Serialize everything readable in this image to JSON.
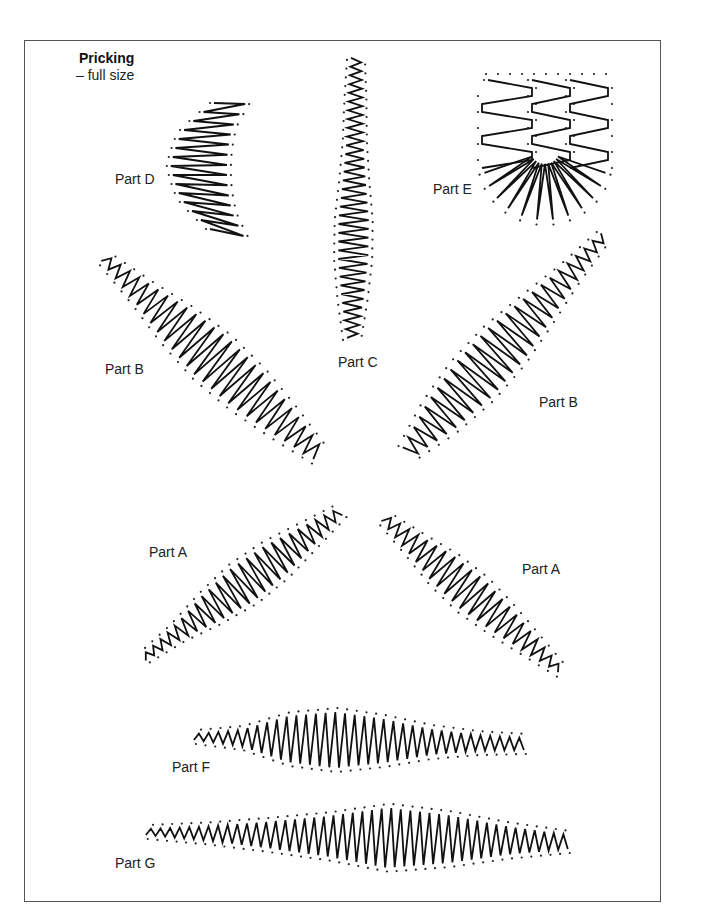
{
  "header": {
    "title": "Pricking",
    "subtitle": "– full size"
  },
  "colors": {
    "frame": "#555555",
    "thread": "#111111",
    "holes": "#222222"
  },
  "parts": [
    {
      "id": "part-d",
      "label": "Part D",
      "label_pos": [
        115,
        172
      ],
      "shape": {
        "start": [
          214,
          100
        ],
        "end": [
          212,
          236
        ],
        "bend": -30,
        "stitches": 14,
        "width": [
          34,
          50,
          56,
          50,
          36
        ],
        "style": "fan"
      }
    },
    {
      "id": "part-c",
      "label": "Part C",
      "label_pos": [
        338,
        355
      ],
      "shape": {
        "start": [
          356,
          58
        ],
        "end": [
          352,
          338
        ],
        "bend": 0,
        "stitches": 32,
        "width": [
          10,
          14,
          16,
          22,
          30,
          30,
          22,
          10
        ],
        "style": "zigzag"
      }
    },
    {
      "id": "part-e",
      "label": "Part E",
      "label_pos": [
        433,
        182
      ],
      "shape": {
        "center": [
          540,
          75
        ],
        "rows": 6,
        "fan_tips": 11,
        "style": "fan-block"
      }
    },
    {
      "id": "part-b-left",
      "label": "Part B",
      "label_pos": [
        105,
        362
      ],
      "shape": {
        "start": [
          104,
          258
        ],
        "end": [
          318,
          454
        ],
        "bend": 0,
        "stitches": 26,
        "width": [
          8,
          22,
          40,
          50,
          46,
          32,
          14
        ],
        "style": "zigzag"
      }
    },
    {
      "id": "part-b-right",
      "label": "Part B",
      "label_pos": [
        539,
        395
      ],
      "shape": {
        "start": [
          604,
          236
        ],
        "end": [
          408,
          452
        ],
        "bend": 0,
        "stitches": 26,
        "width": [
          8,
          18,
          34,
          48,
          50,
          38,
          14
        ],
        "style": "zigzag"
      }
    },
    {
      "id": "part-a-left",
      "label": "Part A",
      "label_pos": [
        149,
        545
      ],
      "shape": {
        "start": [
          144,
          658
        ],
        "end": [
          340,
          512
        ],
        "bend": 0,
        "stitches": 25,
        "width": [
          6,
          14,
          30,
          40,
          36,
          22,
          8
        ],
        "style": "zigzag"
      }
    },
    {
      "id": "part-a-right",
      "label": "Part A",
      "label_pos": [
        522,
        562
      ],
      "shape": {
        "start": [
          384,
          518
        ],
        "end": [
          560,
          670
        ],
        "bend": 0,
        "stitches": 22,
        "width": [
          8,
          20,
          34,
          38,
          30,
          18,
          6
        ],
        "style": "zigzag"
      }
    },
    {
      "id": "part-f",
      "label": "Part F",
      "label_pos": [
        172,
        760
      ],
      "shape": {
        "start": [
          194,
          737
        ],
        "end": [
          524,
          744
        ],
        "bend": 0,
        "stitches": 34,
        "width": [
          6,
          16,
          46,
          56,
          44,
          26,
          16,
          12
        ],
        "style": "zigzag"
      }
    },
    {
      "id": "part-g",
      "label": "Part G",
      "label_pos": [
        115,
        856
      ],
      "shape": {
        "start": [
          146,
          832
        ],
        "end": [
          568,
          842
        ],
        "bend": 0,
        "stitches": 44,
        "width": [
          6,
          14,
          26,
          40,
          60,
          48,
          28,
          14
        ],
        "style": "zigzag"
      }
    }
  ]
}
